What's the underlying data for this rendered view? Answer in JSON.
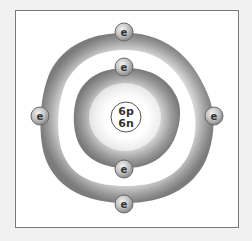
{
  "diagram": {
    "title": "",
    "type": "bohr-model",
    "element": "Carbon",
    "nucleus": {
      "protons_label": "6p",
      "neutrons_label": "6n"
    },
    "shells": [
      {
        "name": "inner-shell",
        "electron_count": 2,
        "electron_label": "e"
      },
      {
        "name": "outer-shell",
        "electron_count": 4,
        "electron_label": "e"
      }
    ],
    "electron_label": "e",
    "colors": {
      "frame_border": "#7a7a7a",
      "shell_dark": "#8c8c8c",
      "shell_light": "#ffffff",
      "electron_fill": "#b5b5b5",
      "background": "#ffffff"
    }
  }
}
